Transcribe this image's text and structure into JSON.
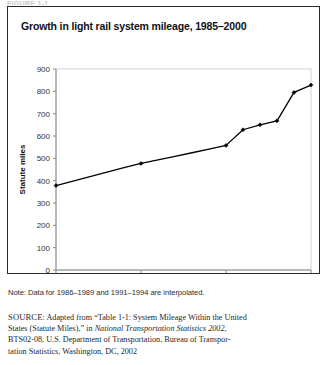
{
  "top_cut_text": "FIGURE 1-1",
  "figure": {
    "title": "Growth in light rail system mileage, 1985–2000",
    "note": "Note: Data for 1986–1989 and 1991–1994 are interpolated.",
    "source": {
      "label": "SOURCE",
      "line1_pre": ": Adapted from “Table 1-1: System Mileage Within the United",
      "line2_pre": "States (Statute Miles),” in ",
      "line2_italic": "National Transportation Statistics 2002",
      "line2_post": ",",
      "line3": "BTS02-08, U.S. Department of Transportation, Bureau of Transpor-",
      "line4": "tation Statistics, Washington, DC, 2002"
    }
  },
  "chart_data": {
    "type": "line",
    "title": "Growth in light rail system mileage, 1985–2000",
    "xlabel": "",
    "ylabel": "Statute miles",
    "xlim": [
      1985,
      2000
    ],
    "ylim": [
      0,
      900
    ],
    "ytick_step": 100,
    "yticks": [
      0,
      100,
      200,
      300,
      400,
      500,
      600,
      700,
      800,
      900
    ],
    "xticks": [
      1985,
      1990,
      1995,
      2000
    ],
    "xtick_labels": [
      "1985",
      "1990",
      "1995",
      "2000"
    ],
    "grid": false,
    "legend": "none",
    "marker": "diamond",
    "line_color": "#000000",
    "x": [
      1985,
      1986,
      1987,
      1988,
      1989,
      1990,
      1991,
      1992,
      1993,
      1994,
      1995,
      1996,
      1997,
      1998,
      1999,
      2000
    ],
    "values": [
      378,
      398,
      418,
      438,
      458,
      477,
      493,
      509,
      525,
      541,
      558,
      628,
      650,
      668,
      795,
      828
    ],
    "marked_points": [
      {
        "year": 1985,
        "value": 378
      },
      {
        "year": 1990,
        "value": 477
      },
      {
        "year": 1995,
        "value": 558
      },
      {
        "year": 1996,
        "value": 628
      },
      {
        "year": 1997,
        "value": 650
      },
      {
        "year": 1998,
        "value": 668
      },
      {
        "year": 1999,
        "value": 795
      },
      {
        "year": 2000,
        "value": 828
      }
    ]
  }
}
